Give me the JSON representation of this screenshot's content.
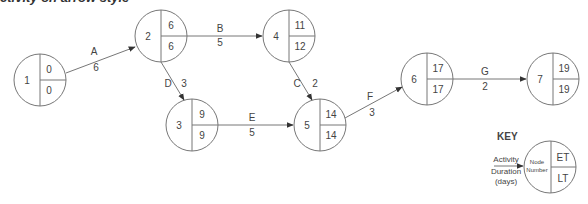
{
  "title": "ctivity on arrow style",
  "nodes": [
    {
      "id": "1",
      "number": "1",
      "et": "0",
      "lt": "0",
      "cx": 40,
      "cy": 80
    },
    {
      "id": "2",
      "number": "2",
      "et": "6",
      "lt": "6",
      "cx": 161,
      "cy": 36
    },
    {
      "id": "3",
      "number": "3",
      "et": "9",
      "lt": "9",
      "cx": 192,
      "cy": 125
    },
    {
      "id": "4",
      "number": "4",
      "et": "11",
      "lt": "12",
      "cx": 289,
      "cy": 36
    },
    {
      "id": "5",
      "number": "5",
      "et": "14",
      "lt": "14",
      "cx": 320,
      "cy": 125
    },
    {
      "id": "6",
      "number": "6",
      "et": "17",
      "lt": "17",
      "cx": 427,
      "cy": 79
    },
    {
      "id": "7",
      "number": "7",
      "et": "19",
      "lt": "19",
      "cx": 553,
      "cy": 79
    }
  ],
  "activities": [
    {
      "name": "A",
      "duration": "6",
      "from": "1",
      "to": "2"
    },
    {
      "name": "B",
      "duration": "5",
      "from": "2",
      "to": "4"
    },
    {
      "name": "C",
      "duration": "2",
      "from": "4",
      "to": "5"
    },
    {
      "name": "D",
      "duration": "3",
      "from": "2",
      "to": "3"
    },
    {
      "name": "E",
      "duration": "5",
      "from": "3",
      "to": "5"
    },
    {
      "name": "F",
      "duration": "3",
      "from": "5",
      "to": "6"
    },
    {
      "name": "G",
      "duration": "2",
      "from": "6",
      "to": "7"
    }
  ],
  "key": {
    "heading": "KEY",
    "activity": "Activity",
    "duration": "Duration",
    "days": "(days)",
    "node_line1": "Node",
    "node_line2": "Number",
    "et": "ET",
    "lt": "LT"
  }
}
